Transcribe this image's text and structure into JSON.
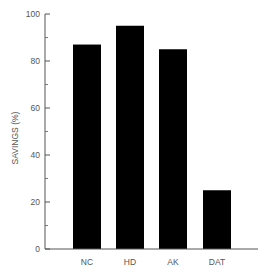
{
  "chart_data": {
    "type": "bar",
    "title": "",
    "xlabel": "",
    "ylabel": "SAVINGS (%)",
    "categories": [
      "NC",
      "HD",
      "AK",
      "DAT"
    ],
    "values": [
      87,
      95,
      85,
      25
    ],
    "ylim": [
      0,
      100
    ],
    "yticks": [
      0,
      20,
      40,
      60,
      80,
      100
    ],
    "minor_yticks": [
      10,
      30,
      50,
      70,
      90
    ],
    "grid": false,
    "legend": null,
    "bar_color": "#000000"
  }
}
